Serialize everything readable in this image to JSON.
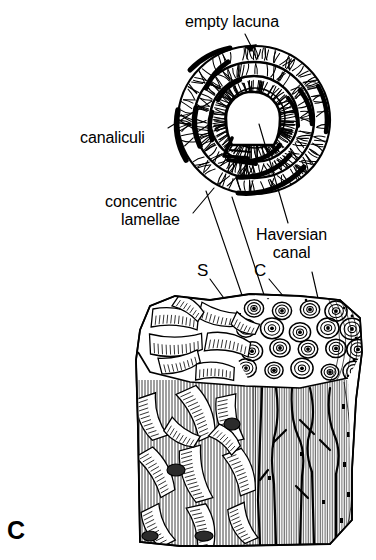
{
  "figure": {
    "panel_letter": "C",
    "background_color": "#ffffff",
    "ink_color": "#000000"
  },
  "labels": {
    "empty_lacuna": "empty lacuna",
    "canaliculi": "canaliculi",
    "concentric_line1": "concentric",
    "concentric_line2": "lamellae",
    "haversian_line1": "Haversian",
    "haversian_line2": "canal"
  },
  "markers": {
    "spongy": "S",
    "compact": "C"
  },
  "diagram": {
    "osteon": {
      "name": "enlarged-osteon-cross-section",
      "center_x": 254,
      "center_y": 120,
      "radius_x": 76,
      "radius_y": 75,
      "ring_count": 4,
      "haversian_canal_radius": 22,
      "lacuna_count": 18
    },
    "bone_block": {
      "name": "cut-block-of-bone",
      "left": 137,
      "top": 293,
      "right": 363,
      "bottom": 546,
      "top_face_depth": 92,
      "spongy_region": "left",
      "compact_region": "right",
      "osteon_circle_count": 22
    },
    "leader_lines": [
      {
        "from": "empty-lacuna-label",
        "x1": 243,
        "y1": 34,
        "x2": 251,
        "y2": 48
      },
      {
        "from": "canaliculi-label",
        "x1": 167,
        "y1": 128,
        "x2": 210,
        "y2": 100
      },
      {
        "from": "concentric-lamellae-label",
        "x1": 193,
        "y1": 212,
        "x2": 213,
        "y2": 188
      },
      {
        "from": "haversian-canal-label",
        "x1": 290,
        "y1": 222,
        "x2": 258,
        "y2": 122
      },
      {
        "from": "magnification-left",
        "x1": 206,
        "y1": 190,
        "x2": 243,
        "y2": 300
      },
      {
        "from": "magnification-right",
        "x1": 232,
        "y1": 196,
        "x2": 264,
        "y2": 300
      },
      {
        "from": "marker-s",
        "x1": 209,
        "y1": 278,
        "x2": 232,
        "y2": 310
      },
      {
        "from": "marker-c",
        "x1": 268,
        "y1": 278,
        "x2": 292,
        "y2": 308
      },
      {
        "from": "haversian-canal-to-block",
        "x1": 310,
        "y1": 270,
        "x2": 318,
        "y2": 306
      }
    ]
  }
}
